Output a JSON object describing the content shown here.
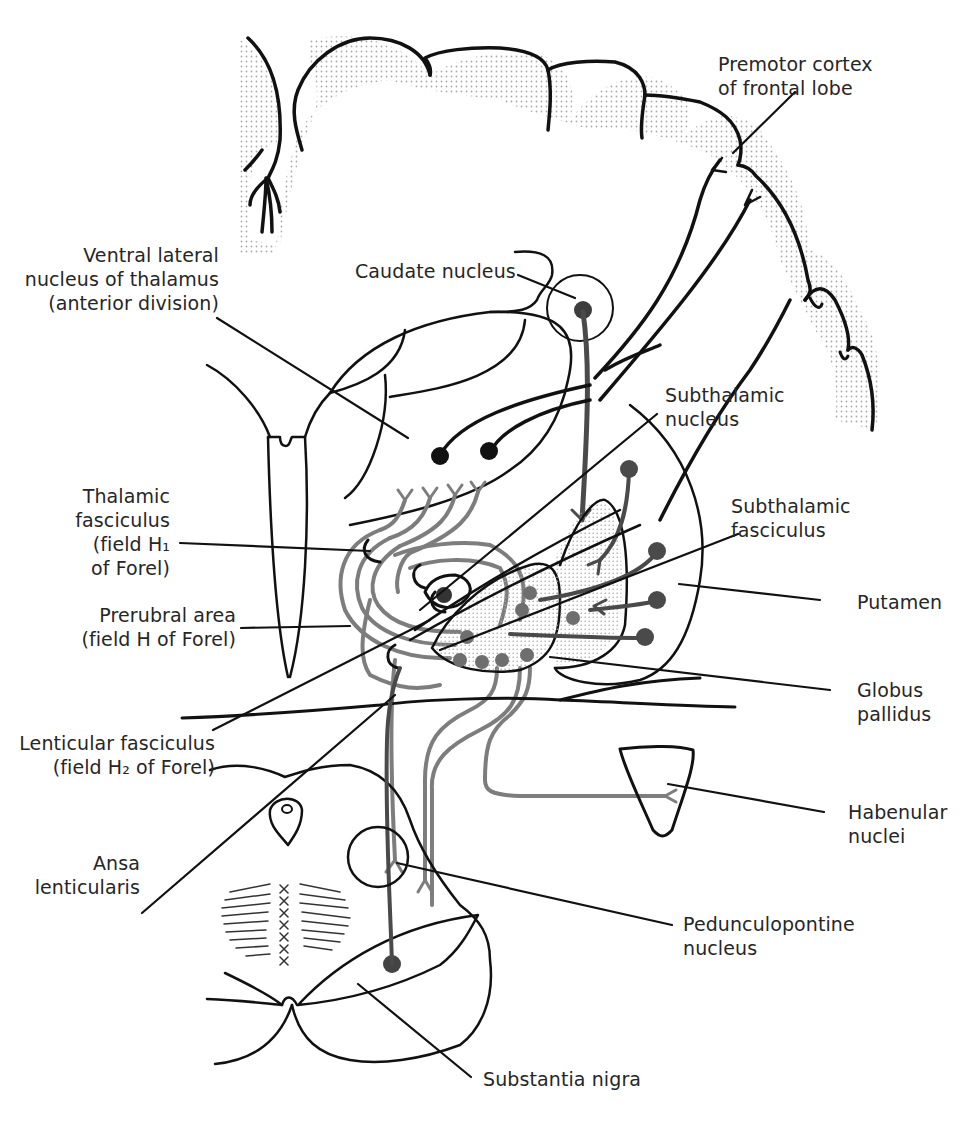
{
  "diagram": {
    "type": "anatomical-schematic",
    "colors": {
      "outline": "#111111",
      "efferent_dark": "#4a4a4a",
      "afferent_gray": "#7d7d7d",
      "stipple": "#b8b8b8",
      "background": "#ffffff"
    }
  },
  "labels": {
    "premotor": {
      "line1": "Premotor cortex",
      "line2": "of frontal lobe"
    },
    "ventral_lateral": {
      "line1": "Ventral lateral",
      "line2": "nucleus of thalamus",
      "line3": "(anterior division)"
    },
    "caudate": {
      "line1": "Caudate nucleus"
    },
    "subthalamic_nucleus": {
      "line1": "Subthalamic",
      "line2": "nucleus"
    },
    "thalamic_fasciculus": {
      "line1": "Thalamic",
      "line2": "fasciculus",
      "line3": "(field H₁",
      "line4": "of Forel)"
    },
    "subthalamic_fasciculus": {
      "line1": "Subthalamic",
      "line2": "fasciculus"
    },
    "prerubral": {
      "line1": "Prerubral area",
      "line2": "(field H of Forel)"
    },
    "putamen": {
      "line1": "Putamen"
    },
    "globus_pallidus": {
      "line1": "Globus",
      "line2": "pallidus"
    },
    "lenticular_fasciculus": {
      "line1": "Lenticular fasciculus",
      "line2": "(field H₂ of Forel)"
    },
    "habenular": {
      "line1": "Habenular",
      "line2": "nuclei"
    },
    "ansa": {
      "line1": "Ansa",
      "line2": "lenticularis"
    },
    "pedunculopontine": {
      "line1": "Pedunculopontine",
      "line2": "nucleus"
    },
    "substantia_nigra": {
      "line1": "Substantia nigra"
    }
  }
}
